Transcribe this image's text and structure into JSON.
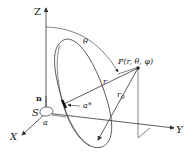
{
  "diagram": {
    "axes": {
      "z": "Z",
      "x": "X",
      "y": "Y"
    },
    "point": {
      "label": "P(r, θ, φ)"
    },
    "labels": {
      "normal": "n",
      "surface": "S",
      "a": "a",
      "a_star": "a*",
      "r": "r",
      "r0": "r",
      "r0_sub": "0",
      "theta": "θ"
    },
    "colors": {
      "ink": "#333333",
      "background": "#ffffff"
    }
  }
}
